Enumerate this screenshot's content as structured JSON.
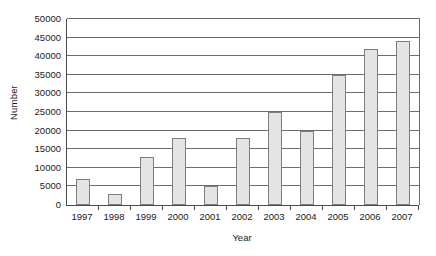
{
  "chart_data": {
    "type": "bar",
    "title": "",
    "subtitle": "",
    "xlabel": "Year",
    "ylabel": "Number",
    "categories": [
      "1997",
      "1998",
      "1999",
      "2000",
      "2001",
      "2002",
      "2003",
      "2004",
      "2005",
      "2006",
      "2007"
    ],
    "values": [
      7000,
      3000,
      13000,
      18000,
      5000,
      18000,
      25000,
      20000,
      35000,
      42000,
      44000
    ],
    "series": [
      {
        "name": "Number",
        "values": [
          7000,
          3000,
          13000,
          18000,
          5000,
          18000,
          25000,
          20000,
          35000,
          42000,
          44000
        ]
      }
    ],
    "ylim": [
      0,
      50000
    ],
    "ytick_values": [
      0,
      5000,
      10000,
      15000,
      20000,
      25000,
      30000,
      35000,
      40000,
      45000,
      50000
    ],
    "ytick_labels": [
      "0",
      "5000",
      "10000",
      "15000",
      "20000",
      "25000",
      "30000",
      "35000",
      "40000",
      "45000",
      "50000"
    ],
    "grid": true,
    "grid_axis": "y",
    "legend": false,
    "legend_position": "none",
    "annotations": [],
    "colors": {
      "bar_fill": "#e4e4e4",
      "bar_border": "#7d7d7d",
      "gridline": "#6d6d6d",
      "axis": "#4a4a4a",
      "text": "#1a1a1a",
      "background": "#ffffff"
    }
  }
}
